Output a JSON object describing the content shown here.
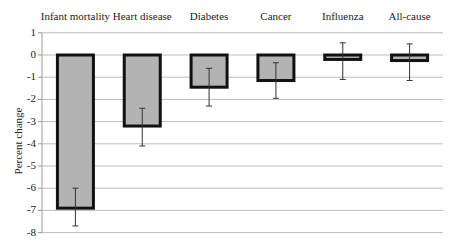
{
  "chart_data": {
    "type": "bar",
    "title": "",
    "xlabel": "",
    "ylabel": "Percent change",
    "ylim": [
      -8,
      1
    ],
    "yticks": [
      1,
      0,
      -1,
      -2,
      -3,
      -4,
      -5,
      -6,
      -7,
      -8
    ],
    "grid": true,
    "legend": null,
    "categories": [
      "Infant mortality",
      "Heart disease",
      "Diabetes",
      "Cancer",
      "Influenza",
      "All-cause"
    ],
    "values": [
      -6.9,
      -3.2,
      -1.45,
      -1.15,
      -0.2,
      -0.25
    ],
    "error_bars": [
      {
        "upper": -6.0,
        "lower": -7.7
      },
      {
        "upper": -2.4,
        "lower": -4.1
      },
      {
        "upper": -0.6,
        "lower": -2.3
      },
      {
        "upper": -0.35,
        "lower": -1.95
      },
      {
        "upper": 0.55,
        "lower": -1.1
      },
      {
        "upper": 0.5,
        "lower": -1.15
      }
    ],
    "category_label_position": "top",
    "colors": {
      "bar_fill": "#b3b3b3",
      "bar_border": "#111111",
      "grid": "#bdbdbd",
      "axis": "#999999",
      "error_bar": "#333333"
    }
  }
}
